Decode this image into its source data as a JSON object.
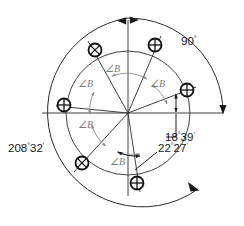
{
  "diagram": {
    "type": "engineering-drawing",
    "center": {
      "x": 128,
      "y": 113
    },
    "circles": [
      {
        "name": "outer-dimension-arc",
        "radius": 95
      },
      {
        "name": "bolt-circle",
        "radius": 62
      }
    ],
    "labels": {
      "angle_90": {
        "value": "90",
        "degree": "°",
        "minutes": ""
      },
      "angle_18_39": {
        "value": "18",
        "degree": "°",
        "minutes": "39",
        "prime": "'"
      },
      "angle_22_27": {
        "value": "22",
        "degree": "°",
        "minutes": "27",
        "prime": "'"
      },
      "angle_208_32": {
        "value": "208",
        "degree": "°",
        "minutes": "32",
        "prime": "'"
      },
      "angle_b": "∠B"
    },
    "angle_b_labels": [
      {
        "id": "angle-b-1",
        "x": 117,
        "y": 73
      },
      {
        "id": "angle-b-2",
        "x": 155,
        "y": 84
      },
      {
        "id": "angle-b-3",
        "x": 95,
        "y": 87
      },
      {
        "id": "angle-b-4",
        "x": 89,
        "y": 122
      },
      {
        "id": "angle-b-5",
        "x": 120,
        "y": 145
      }
    ],
    "holes": [
      {
        "id": "hole-top-left",
        "x": 95,
        "y": 50,
        "cross": "x"
      },
      {
        "id": "hole-top-right",
        "x": 155,
        "y": 45,
        "cross": "plus"
      },
      {
        "id": "hole-right",
        "x": 187,
        "y": 90,
        "cross": "plus"
      },
      {
        "id": "hole-left",
        "x": 64,
        "y": 105,
        "cross": "plus"
      },
      {
        "id": "hole-bottom-left",
        "x": 82,
        "y": 163,
        "cross": "x"
      },
      {
        "id": "hole-bottom",
        "x": 137,
        "y": 183,
        "cross": "plus"
      }
    ],
    "colors": {
      "line": "#1a1a1a",
      "arc": "#2b2b2b",
      "angle_b": "#7d7d7d",
      "background": "#ffffff"
    }
  }
}
